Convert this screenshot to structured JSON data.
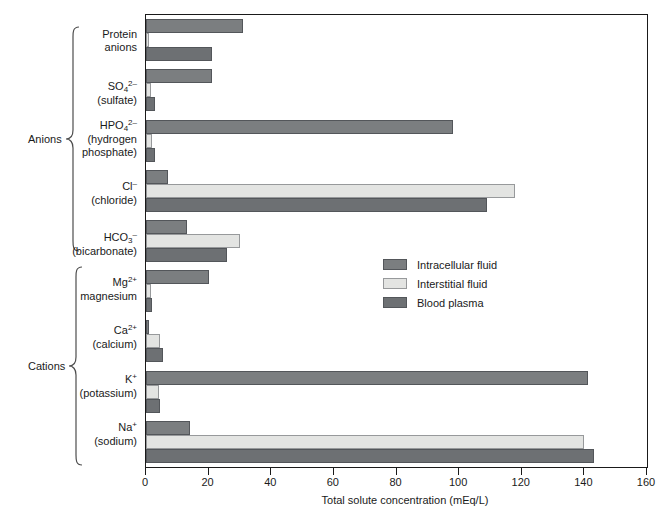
{
  "chart_data": {
    "type": "bar",
    "orientation": "horizontal",
    "title": "",
    "xlabel": "Total solute concentration (mEq/L)",
    "ylabel": "",
    "xlim": [
      0,
      160
    ],
    "xticks": [
      0,
      20,
      40,
      60,
      80,
      100,
      120,
      140,
      160
    ],
    "grid": false,
    "legend_position": "center-right-inside",
    "series": [
      {
        "name": "Intracellular fluid",
        "color": "#7b7e80",
        "values": [
          14,
          141,
          0.5,
          20,
          13,
          7,
          98,
          21,
          31
        ]
      },
      {
        "name": "Interstitial fluid",
        "color": "#e3e4e2",
        "values": [
          140,
          4,
          4.5,
          1.5,
          30,
          118,
          2,
          1.5,
          1
        ]
      },
      {
        "name": "Blood plasma",
        "color": "#6d7073",
        "values": [
          143,
          4.5,
          5.5,
          2,
          26,
          109,
          3,
          3,
          21
        ]
      }
    ],
    "categories": [
      "Na+ (sodium)",
      "K+ (potassium)",
      "Ca2+ (calcium)",
      "Mg2+ magnesium",
      "HCO3- (bicarbonate)",
      "Cl- (chloride)",
      "HPO4 2- (hydrogen phosphate)",
      "SO4 2- (sulfate)",
      "Protein anions"
    ],
    "groups": [
      {
        "label": "Anions",
        "categories": [
          "Protein anions",
          "SO4 2- (sulfate)",
          "HPO4 2- (hydrogen phosphate)",
          "Cl- (chloride)",
          "HCO3- (bicarbonate)"
        ]
      },
      {
        "label": "Cations",
        "categories": [
          "Mg2+ magnesium",
          "Ca2+ (calcium)",
          "K+ (potassium)",
          "Na+ (sodium)"
        ]
      }
    ]
  },
  "groups": {
    "anions_label": "Anions",
    "cations_label": "Cations"
  },
  "categories": {
    "protein_line1": "Protein",
    "protein_line2": "anions",
    "sulfate_ion": "SO",
    "sulfate_sub": "4",
    "sulfate_sup": "2–",
    "sulfate_name": "(sulfate)",
    "phosphate_ion": "HPO",
    "phosphate_sub": "4",
    "phosphate_sup": "2–",
    "phosphate_name1": "(hydrogen",
    "phosphate_name2": "phosphate)",
    "chloride_ion": "Cl",
    "chloride_sup": "–",
    "chloride_name": "(chloride)",
    "bicarbonate_ion": "HCO",
    "bicarbonate_sub": "3",
    "bicarbonate_sup": "–",
    "bicarbonate_name": "(bicarbonate)",
    "magnesium_ion": "Mg",
    "magnesium_sup": "2+",
    "magnesium_name": "magnesium",
    "calcium_ion": "Ca",
    "calcium_sup": "2+",
    "calcium_name": "(calcium)",
    "potassium_ion": "K",
    "potassium_sup": "+",
    "potassium_name": "(potassium)",
    "sodium_ion": "Na",
    "sodium_sup": "+",
    "sodium_name": "(sodium)"
  },
  "axis": {
    "title": "Total solute concentration (mEq/L)",
    "ticks": [
      "0",
      "20",
      "40",
      "60",
      "80",
      "100",
      "120",
      "140",
      "160"
    ]
  },
  "legend": {
    "items": [
      {
        "label": "Intracellular fluid",
        "color": "#7b7e80"
      },
      {
        "label": "Interstitial fluid",
        "color": "#e3e4e2"
      },
      {
        "label": "Blood plasma",
        "color": "#6d7073"
      }
    ]
  }
}
